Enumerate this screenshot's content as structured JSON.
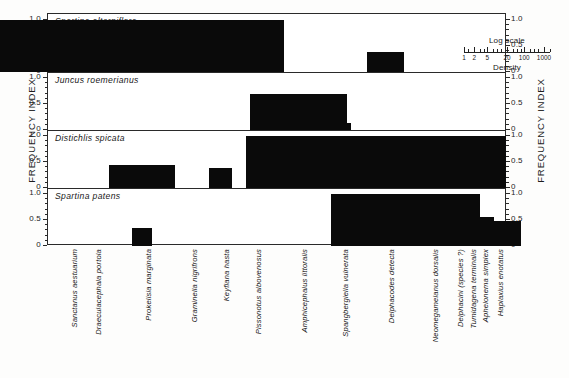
{
  "figure": {
    "y_axis_label_left": "FREQUENCY INDEX",
    "y_axis_label_right": "FREQUENCY INDEX"
  },
  "legend": {
    "title": "Log scale",
    "caption": "Density",
    "ticks": [
      "1",
      "2",
      "5",
      "20",
      "100",
      "1000"
    ]
  },
  "y_ticks": {
    "t0": "0",
    "t05": "0.5",
    "t10": "1.0"
  },
  "species": [
    "Sanctanus aestuarium",
    "Draeculacephala portola",
    "Prokelisia marginata",
    "Graminella nigrifrons",
    "Keyflana hasta",
    "Pissonotus albovenosus",
    "Amphicephalus littoralis",
    "Spangbergiella vulnerata",
    "Delphacodes detecta",
    "Neomegamelanus dorsalis",
    "Delphacini (species ?)",
    "Tumidagena terminalis",
    "Aphelonema simplex",
    "Haplaxius enotatus"
  ],
  "panels": [
    {
      "title": "Spartina alterniflora"
    },
    {
      "title": "Juncus roemerianus"
    },
    {
      "title": "Distichlis spicata"
    },
    {
      "title": "Spartina patens"
    }
  ],
  "chart_data": {
    "type": "bar",
    "xlabel": "",
    "ylabel": "FREQUENCY INDEX",
    "ylim": [
      0,
      1.0
    ],
    "ytick_values": [
      0,
      0.5,
      1.0
    ],
    "grid": false,
    "legend_position": "top-right",
    "note": "Bar height = frequency index (0-1.0); bar width = density on a log scale (1, 2, 5, 20, 100, 1000)",
    "categories": [
      "Sanctanus aestuarium",
      "Draeculacephala portola",
      "Prokelisia marginata",
      "Graminella nigrifrons",
      "Keyflana hasta",
      "Pissonotus albovenosus",
      "Amphicephalus littoralis",
      "Spangbergiella vulnerata",
      "Delphacodes detecta",
      "Neomegamelanus dorsalis",
      "Delphacini (species ?)",
      "Tumidagena terminalis",
      "Aphelonema simplex",
      "Haplaxius enotatus"
    ],
    "series": [
      {
        "name": "Spartina alterniflora",
        "values": [
          0.5,
          0.42,
          1.0,
          0.3,
          0,
          0,
          0,
          0,
          0.38,
          0,
          0,
          0,
          0,
          0
        ],
        "widths": [
          20,
          12,
          100,
          9,
          0,
          0,
          0,
          0,
          13,
          0,
          0,
          0,
          0,
          0
        ]
      },
      {
        "name": "Juncus roemerianus",
        "values": [
          0,
          0,
          0,
          0,
          0,
          0,
          0.7,
          0.13,
          0,
          0,
          0,
          0,
          0,
          0
        ],
        "widths": [
          0,
          0,
          0,
          0,
          0,
          0,
          34,
          8,
          0,
          0,
          0,
          0,
          0,
          0
        ]
      },
      {
        "name": "Distichlis spicata",
        "values": [
          0,
          0,
          0.44,
          0,
          0.38,
          0,
          0.22,
          1.0,
          0.8,
          1.0,
          0.7,
          0.12,
          0.55,
          0.5
        ],
        "widths": [
          0,
          0,
          23,
          0,
          8,
          0,
          8,
          66,
          29,
          54,
          27,
          10,
          8,
          1
        ]
      },
      {
        "name": "Spartina patens",
        "values": [
          0,
          0,
          0.35,
          0,
          0,
          0,
          0,
          0,
          1.0,
          1.0,
          0,
          0.55,
          0.55,
          0.48
        ],
        "widths": [
          0,
          0,
          7,
          0,
          0,
          0,
          0,
          0,
          38,
          36,
          0,
          10,
          10,
          19
        ]
      }
    ]
  }
}
